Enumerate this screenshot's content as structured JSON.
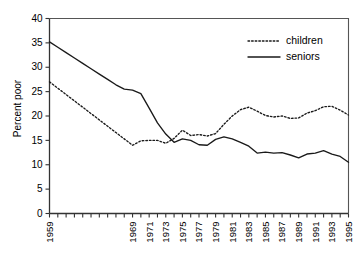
{
  "chart_data": {
    "type": "line",
    "title": "",
    "xlabel": "",
    "ylabel": "Percent poor",
    "ylim": [
      0,
      40
    ],
    "yticks": [
      0,
      5,
      10,
      15,
      20,
      25,
      30,
      35,
      40
    ],
    "xlim": [
      1959,
      1995
    ],
    "grid": false,
    "legend_position": "upper right",
    "x": [
      1959,
      1960,
      1961,
      1962,
      1963,
      1964,
      1965,
      1966,
      1967,
      1968,
      1969,
      1970,
      1971,
      1972,
      1973,
      1974,
      1975,
      1976,
      1977,
      1978,
      1979,
      1980,
      1981,
      1982,
      1983,
      1984,
      1985,
      1986,
      1987,
      1988,
      1989,
      1990,
      1991,
      1992,
      1993,
      1994,
      1995
    ],
    "xtick_labels": [
      "1959",
      "",
      "",
      "",
      "",
      "",
      "",
      "",
      "",
      "",
      "1969",
      "",
      "1971",
      "",
      "1973",
      "",
      "1975",
      "",
      "1977",
      "",
      "1979",
      "",
      "1981",
      "",
      "1983",
      "",
      "1985",
      "",
      "1987",
      "",
      "1989",
      "",
      "1991",
      "",
      "1993",
      "",
      "1995"
    ],
    "series": [
      {
        "name": "children",
        "style": "dotted",
        "color": "#1a1a1a",
        "values": [
          27.0,
          25.7,
          24.4,
          23.1,
          21.8,
          20.5,
          19.2,
          17.9,
          16.6,
          15.3,
          14.0,
          14.9,
          15.0,
          15.0,
          14.4,
          15.4,
          17.1,
          16.0,
          16.2,
          15.9,
          16.4,
          18.3,
          20.0,
          21.3,
          21.8,
          21.0,
          20.1,
          19.8,
          20.0,
          19.5,
          19.6,
          20.6,
          21.1,
          21.9,
          22.0,
          21.2,
          20.2
        ]
      },
      {
        "name": "seniors",
        "style": "solid",
        "color": "#1a1a1a",
        "values": [
          35.2,
          34.1,
          33.0,
          31.9,
          30.8,
          29.7,
          28.6,
          27.5,
          26.4,
          25.5,
          25.3,
          24.6,
          21.6,
          18.6,
          16.3,
          14.6,
          15.3,
          15.0,
          14.1,
          14.0,
          15.2,
          15.7,
          15.3,
          14.6,
          13.8,
          12.4,
          12.6,
          12.4,
          12.5,
          12.0,
          11.4,
          12.2,
          12.4,
          12.9,
          12.2,
          11.7,
          10.5
        ]
      }
    ]
  },
  "legend": {
    "items": [
      {
        "label": "children",
        "style": "dotted"
      },
      {
        "label": "seniors",
        "style": "solid"
      }
    ]
  },
  "axis": {
    "y_label": "Percent poor"
  }
}
